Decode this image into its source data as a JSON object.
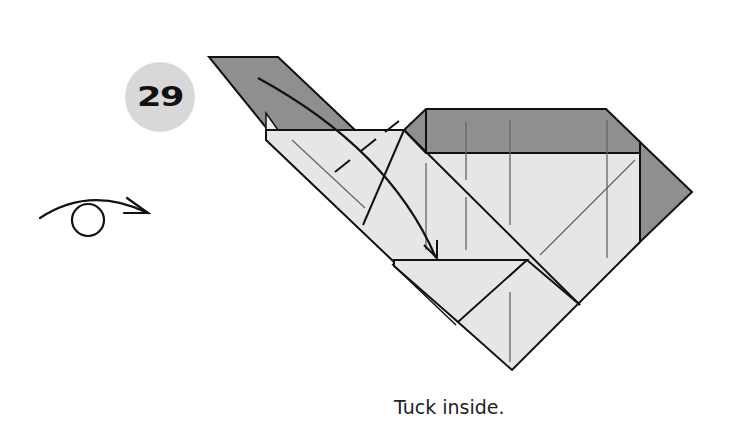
{
  "step": {
    "number": "29"
  },
  "caption": {
    "text": "Tuck inside."
  },
  "symbols": {
    "turn_over": "turn-over-icon",
    "tuck_arrow": "curved-arrow-icon"
  },
  "colors": {
    "paper_light": "#e6e6e6",
    "paper_dark": "#8f8f8f",
    "line": "#111111",
    "crease": "#666666",
    "badge": "#d8d8d8"
  }
}
